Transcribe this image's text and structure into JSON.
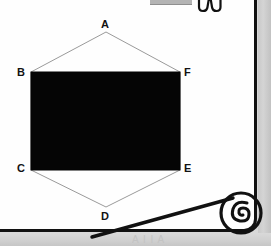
{
  "document": {
    "background_color": "#d8d8d8",
    "page_color": "#fefefe",
    "border_color": "#111111"
  },
  "figure": {
    "name": "hexagon-with-inscribed-rectangle",
    "stroke_color": "#8a8a8a",
    "fill_color": "#050505",
    "vertex_labels": [
      {
        "id": "A",
        "label": "A",
        "x": 106,
        "y": 32
      },
      {
        "id": "B",
        "label": "B",
        "x": 31,
        "y": 72
      },
      {
        "id": "C",
        "label": "C",
        "x": 31,
        "y": 170
      },
      {
        "id": "D",
        "label": "D",
        "x": 106,
        "y": 207
      },
      {
        "id": "E",
        "label": "E",
        "x": 180,
        "y": 170
      },
      {
        "id": "F",
        "label": "F",
        "x": 180,
        "y": 72
      }
    ],
    "rectangle": {
      "left": 31,
      "top": 72,
      "right": 180,
      "bottom": 170
    }
  },
  "overlays": {
    "top_bar_label": "",
    "top_glyph_name": "m-shape-outline-icon",
    "corner_curl_name": "page-curl-spiral",
    "footer_ghost_text": "A  I  I  A"
  }
}
